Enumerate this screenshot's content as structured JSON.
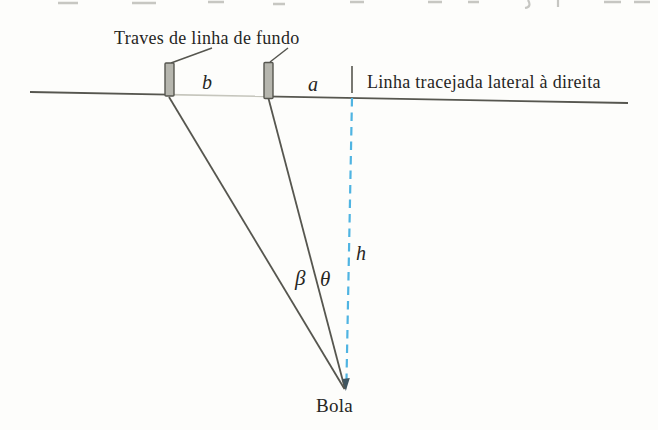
{
  "figure_labels": {
    "goal_posts": "Traves de linha de fundo",
    "sideline": "Linha tracejada lateral à direita",
    "ball": "Bola",
    "segment_b": "b",
    "segment_a": "a",
    "angle_beta": "β",
    "angle_theta": "θ",
    "height_h": "h"
  },
  "colors": {
    "stroke": "#56564f",
    "stroke_light": "#c6c6bd",
    "dashed_line": "#4fb4e2",
    "arrow_tip": "#3f5560",
    "post_fill": "#b6b6ae",
    "post_border": "#56564f",
    "fragment_gray": "#9a9a94",
    "text": "#26261f",
    "background": "#fdfdfb"
  }
}
